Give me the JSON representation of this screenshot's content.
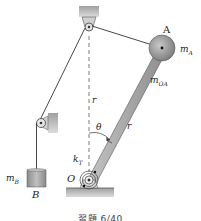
{
  "figure": {
    "caption": "習題 6/40",
    "labels": {
      "A": "A",
      "mA_main": "m",
      "mA_sub": "A",
      "mOA_main": "m",
      "mOA_sub": "OA",
      "r_upper": "r",
      "r_bar": "r",
      "theta": "θ",
      "kT_main": "k",
      "kT_sub": "T",
      "O": "O",
      "mB_main": "m",
      "mB_sub": "B",
      "B": "B"
    },
    "colors": {
      "ground": "#9a9a9a",
      "bar": "#a8a8a8",
      "sphere": "#8c8c8c",
      "block": "#9e9e9e",
      "line": "#333333",
      "bracket": "#b0b0b0"
    }
  }
}
